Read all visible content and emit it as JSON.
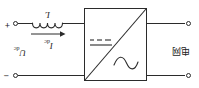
{
  "figure": {
    "type": "circuit-diagram",
    "orientation_note": "scan is rotated 180 degrees"
  },
  "source": {
    "label": "电网",
    "terminal_top": "grid-terminal-top",
    "terminal_bottom": "grid-terminal-bottom"
  },
  "converter": {
    "name": "AC/DC converter block",
    "ac_symbol": "sine-wave",
    "dc_symbol": "dc-dashed-solid",
    "divider": "diagonal-line"
  },
  "inductor": {
    "label": "L",
    "turns": 4
  },
  "current": {
    "label": "I",
    "subscript": "dc",
    "arrow": "left"
  },
  "voltage": {
    "label": "U",
    "subscript": "dc"
  },
  "polarity": {
    "positive": "+",
    "negative": "−"
  },
  "colors": {
    "line": "#2b2b2b",
    "text": "#1c1c1c",
    "background": "#ffffff"
  }
}
